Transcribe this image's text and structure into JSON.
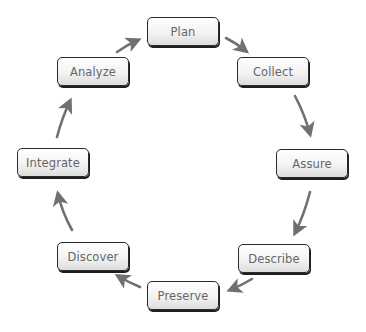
{
  "diagram": {
    "type": "cycle",
    "colors": {
      "arrow": "#707070",
      "node_border": "#2a2a2a",
      "node_text": "#666666"
    },
    "nodes": [
      {
        "id": "plan",
        "label": "Plan",
        "x": 147,
        "y": 17
      },
      {
        "id": "collect",
        "label": "Collect",
        "x": 237,
        "y": 57
      },
      {
        "id": "assure",
        "label": "Assure",
        "x": 276,
        "y": 149
      },
      {
        "id": "describe",
        "label": "Describe",
        "x": 238,
        "y": 244
      },
      {
        "id": "preserve",
        "label": "Preserve",
        "x": 147,
        "y": 281
      },
      {
        "id": "discover",
        "label": "Discover",
        "x": 57,
        "y": 242
      },
      {
        "id": "integrate",
        "label": "Integrate",
        "x": 17,
        "y": 148
      },
      {
        "id": "analyze",
        "label": "Analyze",
        "x": 57,
        "y": 57
      }
    ],
    "edges": [
      {
        "from": "plan",
        "to": "collect"
      },
      {
        "from": "collect",
        "to": "assure"
      },
      {
        "from": "assure",
        "to": "describe"
      },
      {
        "from": "describe",
        "to": "preserve"
      },
      {
        "from": "preserve",
        "to": "discover"
      },
      {
        "from": "discover",
        "to": "integrate"
      },
      {
        "from": "integrate",
        "to": "analyze"
      },
      {
        "from": "analyze",
        "to": "plan"
      }
    ]
  }
}
